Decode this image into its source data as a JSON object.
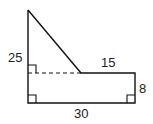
{
  "diagram": {
    "labels": {
      "left_height": "25",
      "top_right_width": "15",
      "right_height": "8",
      "bottom_width": "30"
    },
    "right_angle_marks": 3,
    "dashed_line": true,
    "colors": {
      "stroke": "#111111",
      "background": "#ffffff"
    }
  }
}
